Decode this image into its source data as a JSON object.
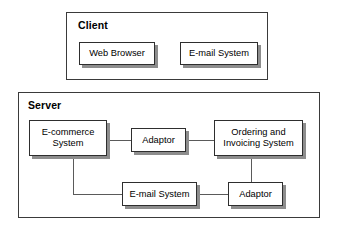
{
  "diagram": {
    "type": "block-diagram",
    "colors": {
      "background": "#ffffff",
      "box_border": "#2e2e2e",
      "tier_border": "#3a3a3a",
      "shadow": "#8d8d8d",
      "connector": "#5a5a5a",
      "text": "#000000"
    },
    "tiers": [
      {
        "id": "client",
        "label": "Client"
      },
      {
        "id": "server",
        "label": "Server"
      }
    ],
    "nodes": {
      "web_browser": {
        "label": "Web Browser"
      },
      "client_email": {
        "label": "E-mail System"
      },
      "ecommerce": {
        "label": "E-commerce\nSystem"
      },
      "adaptor_top": {
        "label": "Adaptor"
      },
      "ordering": {
        "label": "Ordering and\nInvoicing System"
      },
      "server_email": {
        "label": "E-mail System"
      },
      "adaptor_bottom": {
        "label": "Adaptor"
      }
    },
    "connections": [
      {
        "from": "ecommerce",
        "to": "adaptor_top",
        "style": "straight-horizontal"
      },
      {
        "from": "adaptor_top",
        "to": "ordering",
        "style": "straight-horizontal"
      },
      {
        "from": "ecommerce",
        "to": "server_email",
        "style": "elbow-down-right"
      },
      {
        "from": "server_email",
        "to": "adaptor_bottom",
        "style": "straight-horizontal"
      },
      {
        "from": "ordering",
        "to": "adaptor_bottom",
        "style": "straight-vertical"
      }
    ]
  }
}
